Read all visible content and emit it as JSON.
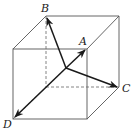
{
  "figure": {
    "type": "cube-vector-diagram",
    "colors": {
      "edge": "#555555",
      "hidden_edge": "#666666",
      "vector": "#1a1a1a",
      "label": "#222222",
      "background": "#ffffff"
    },
    "origin": {
      "x": 66,
      "y": 68
    },
    "points": [
      {
        "id": "A",
        "label": "A",
        "x": 86,
        "y": 49,
        "label_x": 79,
        "label_y": 45
      },
      {
        "id": "B",
        "label": "B",
        "x": 46,
        "y": 16,
        "label_x": 41,
        "label_y": 12
      },
      {
        "id": "C",
        "label": "C",
        "x": 118,
        "y": 87,
        "label_x": 122,
        "label_y": 92
      },
      {
        "id": "D",
        "label": "D",
        "x": 14,
        "y": 118,
        "label_x": 3,
        "label_y": 128
      }
    ],
    "front_face": {
      "x1": 13,
      "y1": 49,
      "x2": 87,
      "y2": 119
    },
    "back_face": {
      "x1": 46,
      "y1": 16,
      "x2": 119,
      "y2": 87
    },
    "hidden_edges": [
      "back-left-vertical",
      "back-bottom-horizontal",
      "bottom-left-depth"
    ]
  }
}
